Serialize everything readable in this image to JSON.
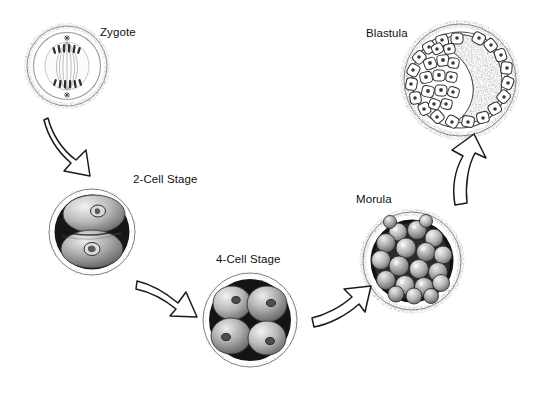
{
  "diagram": {
    "type": "cycle-flow",
    "background_color": "#ffffff",
    "ink_color": "#101010",
    "stages": [
      {
        "id": "zygote",
        "label": "Zygote",
        "label_x": 100,
        "label_y": 26,
        "cx": 67,
        "cy": 66,
        "r": 41,
        "description": "single cell with mitotic spindle and chromosomes at metaphase plate",
        "cell_count": 1,
        "appearance": "light stippled ring with internal spindle fibers"
      },
      {
        "id": "two-cell",
        "label": "2-Cell Stage",
        "label_x": 133,
        "label_y": 173,
        "cx": 92,
        "cy": 232,
        "r": 44,
        "description": "two blastomeres each with a visible nucleus inside the zona pellucida",
        "cell_count": 2,
        "appearance": "dark interior with two shaded rounded cells"
      },
      {
        "id": "four-cell",
        "label": "4-Cell Stage",
        "label_x": 216,
        "label_y": 253,
        "cx": 250,
        "cy": 320,
        "r": 48,
        "description": "four rounded blastomeres clustered within the zona pellucida",
        "cell_count": 4,
        "appearance": "dark interior with four shaded nucleated cells"
      },
      {
        "id": "morula",
        "label": "Morula",
        "label_x": 356,
        "label_y": 193,
        "cx": 412,
        "cy": 261,
        "r": 50,
        "description": "solid ball of many tightly packed blastomeres",
        "cell_count": 20,
        "appearance": "stippled outer shell with dense mulberry-like cell mass"
      },
      {
        "id": "blastula",
        "label": "Blastula",
        "label_x": 366,
        "label_y": 27,
        "cx": 460,
        "cy": 80,
        "r": 57,
        "description": "hollow ball with a ring of nucleated cells around a dark inner mass and blastocoel",
        "cell_count": 34,
        "appearance": "stippled shell, ring of white nucleated cells, dark crescent inner region"
      }
    ],
    "arrows": [
      {
        "id": "zygote-to-two-cell",
        "from": "zygote",
        "to": "two-cell",
        "direction": "down",
        "style": "hollow-outline"
      },
      {
        "id": "two-cell-to-four-cell",
        "from": "two-cell",
        "to": "four-cell",
        "direction": "down-right",
        "style": "hollow-outline"
      },
      {
        "id": "four-cell-to-morula",
        "from": "four-cell",
        "to": "morula",
        "direction": "right-up",
        "style": "hollow-outline"
      },
      {
        "id": "morula-to-blastula",
        "from": "morula",
        "to": "blastula",
        "direction": "up",
        "style": "hollow-outline"
      }
    ]
  }
}
